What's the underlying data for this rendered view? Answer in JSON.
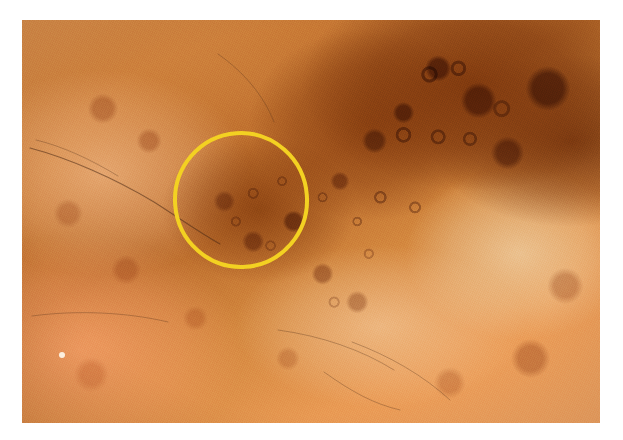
{
  "view": {
    "kind": "dermoscopy-photograph",
    "width": 623,
    "height": 440,
    "background_color": "#ffffff",
    "alt_text": "Dermoscopic close-up photograph of pigmented skin showing a light-brown to dark-brown mottled pattern, with a yellow circle annotating a region of structureless dark-brown pigmentation."
  },
  "photo": {
    "left": 22,
    "top": 20,
    "width": 578,
    "height": 403,
    "palette": {
      "light_salmon": "#f0a565",
      "mid_orange": "#d98f4c",
      "tan_orange": "#c97a35",
      "deep_brown": "#7c360c",
      "darkest_brown": "#5c2606",
      "cream_patch": "#eecda0",
      "hair_stroke": "#483214"
    },
    "regions": [
      {
        "name": "upper-right-dark-pigment-field",
        "tone": "#7c360c"
      },
      {
        "name": "right-cream-hypopigmented-patch",
        "tone": "#eecda0"
      },
      {
        "name": "lower-left-light-salmon-skin",
        "tone": "#f0a565"
      },
      {
        "name": "central-brown-blotch",
        "tone": "#8a4010"
      }
    ],
    "hairs": [
      {
        "name": "hair-upper-left-long-arc",
        "d": "M 8 128 C 46 138 92 158 132 182 C 160 200 180 214 198 224"
      },
      {
        "name": "hair-upper-left-short",
        "d": "M 14 120 C 40 126 70 140 96 156"
      },
      {
        "name": "hair-upper-center-arc",
        "d": "M 196 34 C 222 52 242 76 252 102"
      },
      {
        "name": "hair-mid-left-faint",
        "d": "M 10 296 C 54 290 104 292 146 302"
      },
      {
        "name": "hair-lower-center-arc",
        "d": "M 256 310 C 300 316 340 330 372 350"
      },
      {
        "name": "hair-lower-right-arc",
        "d": "M 302 352 C 330 372 352 384 378 390"
      },
      {
        "name": "hair-lower-right-long",
        "d": "M 330 322 C 368 336 402 356 428 380"
      }
    ],
    "specular_highlight": {
      "name": "white-speck",
      "left": 37,
      "top": 332,
      "size": 6,
      "color": "#fdf4e6"
    }
  },
  "annotation": {
    "shape": "circle",
    "label": "region-of-interest-circle",
    "stroke_color": "#f3d122",
    "stroke_width": 4,
    "center_x": 241,
    "center_y": 200,
    "radius_x": 66,
    "radius_y": 67,
    "rotation_deg": -4
  }
}
